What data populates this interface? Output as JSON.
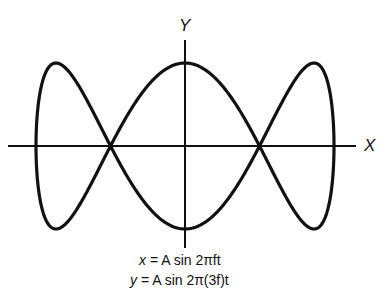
{
  "diagram": {
    "type": "lissajous-figure",
    "axes": {
      "x_label": "X",
      "y_label": "Y"
    },
    "equations": [
      {
        "lhs": "x",
        "rhs": "A sin 2πft"
      },
      {
        "lhs": "y",
        "rhs": "A sin 2π(3f)t"
      }
    ],
    "frequency_ratio": "1:3",
    "lobes": 3,
    "colors": {
      "stroke": "#111111",
      "background": "#ffffff"
    }
  }
}
